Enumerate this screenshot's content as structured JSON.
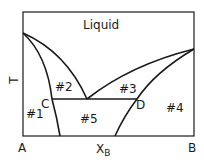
{
  "diagram": {
    "type": "binary phase diagram (eutectic with partial solid solubility)",
    "title_region": "Liquid",
    "axes": {
      "y_label": "T",
      "x_label": "X",
      "x_label_sub": "B",
      "left_end": "A",
      "right_end": "B"
    },
    "points": {
      "C": "C",
      "D": "D"
    },
    "regions": [
      {
        "id": "r1",
        "label": "#1"
      },
      {
        "id": "r2",
        "label": "#2"
      },
      {
        "id": "r3",
        "label": "#3"
      },
      {
        "id": "r4",
        "label": "#4"
      },
      {
        "id": "r5",
        "label": "#5"
      }
    ],
    "colors": {
      "line": "#1a1a1a",
      "background": "#ffffff"
    }
  }
}
